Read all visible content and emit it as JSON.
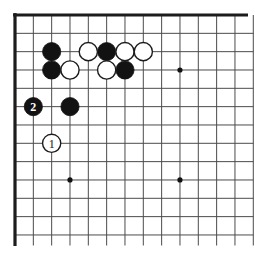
{
  "diagram": {
    "type": "go-board-corner-diagram",
    "corner_shown": "top-left",
    "board": {
      "origin_x": 15,
      "origin_y": 15,
      "cell": 18.33,
      "cols": 14,
      "rows": 13,
      "line_width": 1,
      "edge_width": 3.2,
      "v_line_end_y": 245.5,
      "h_line_end_x": 253.4,
      "top_edge_end_x": 248,
      "left_edge_end_y": 246,
      "star_radius": 2.6,
      "stone_radius": 9.1,
      "label_font_size": 12
    },
    "colors": {
      "background": "#ffffff",
      "grid_line": "#4b4b4b",
      "board_edge": "#1c1c1c",
      "star_point": "#111111",
      "black_stone": "#121212",
      "white_stone": "#ffffff",
      "stone_outline": "#1c1c1c",
      "label_on_black": "#ffffff",
      "label_on_white": "#111111"
    },
    "star_points": [
      {
        "col": 9,
        "row": 3
      },
      {
        "col": 3,
        "row": 9
      },
      {
        "col": 9,
        "row": 9
      }
    ],
    "stones": [
      {
        "col": 2,
        "row": 2,
        "color": "black",
        "label": ""
      },
      {
        "col": 5,
        "row": 2,
        "color": "black",
        "label": ""
      },
      {
        "col": 2,
        "row": 3,
        "color": "black",
        "label": ""
      },
      {
        "col": 6,
        "row": 3,
        "color": "black",
        "label": ""
      },
      {
        "col": 3,
        "row": 5,
        "color": "black",
        "label": ""
      },
      {
        "col": 1,
        "row": 5,
        "color": "black",
        "label": "2"
      },
      {
        "col": 4,
        "row": 2,
        "color": "white",
        "label": ""
      },
      {
        "col": 6,
        "row": 2,
        "color": "white",
        "label": ""
      },
      {
        "col": 7,
        "row": 2,
        "color": "white",
        "label": ""
      },
      {
        "col": 3,
        "row": 3,
        "color": "white",
        "label": ""
      },
      {
        "col": 5,
        "row": 3,
        "color": "white",
        "label": ""
      },
      {
        "col": 2,
        "row": 7,
        "color": "white",
        "label": "1"
      }
    ]
  }
}
